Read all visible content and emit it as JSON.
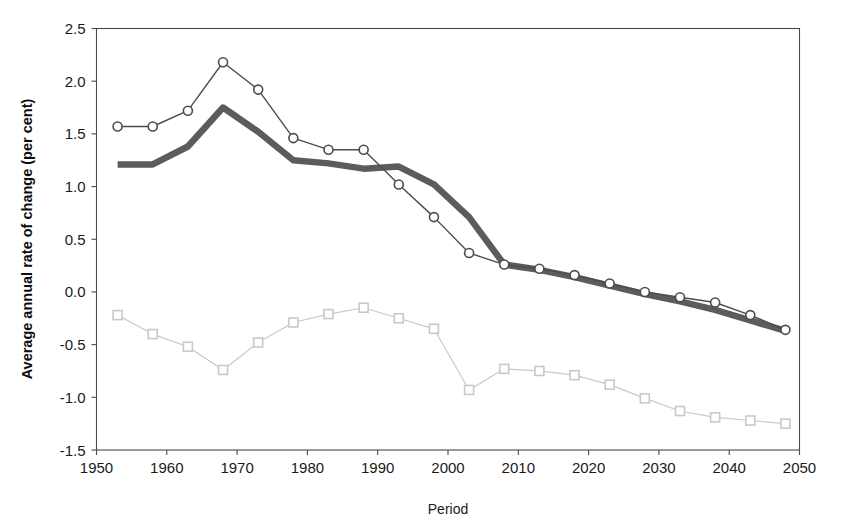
{
  "chart_data": {
    "type": "line",
    "title": "",
    "xlabel": "Period",
    "ylabel": "Average annual rate of change (per cent)",
    "xlim": [
      1950,
      2050
    ],
    "ylim": [
      -1.5,
      2.5
    ],
    "xticks": [
      1950,
      1960,
      1970,
      1980,
      1990,
      2000,
      2010,
      2020,
      2030,
      2040,
      2050
    ],
    "xtick_labels": [
      "1950",
      "1960",
      "1970",
      "1980",
      "1990",
      "2000",
      "2010",
      "2020",
      "2030",
      "2040",
      "2050"
    ],
    "yticks": [
      -1.5,
      -1.0,
      -0.5,
      0.0,
      0.5,
      1.0,
      1.5,
      2.0,
      2.5
    ],
    "ytick_labels": [
      "-1.5",
      "-1.0",
      "-0.5",
      "0.0",
      "0.5",
      "1.0",
      "1.5",
      "2.0",
      "2.5"
    ],
    "grid": false,
    "legend": "none",
    "x": [
      1953,
      1958,
      1963,
      1968,
      1973,
      1978,
      1983,
      1988,
      1993,
      1998,
      2003,
      2008,
      2013,
      2018,
      2023,
      2028,
      2033,
      2038,
      2043,
      2048
    ],
    "series": [
      {
        "name": "circle-series",
        "marker": "circle-open",
        "color": "#4d4d4d",
        "line_width": 1.4,
        "marker_size": 9,
        "x": [
          1953,
          1958,
          1963,
          1968,
          1973,
          1978,
          1983,
          1988,
          1993,
          1998,
          2003,
          2008,
          2013,
          2018,
          2023,
          2028,
          2033,
          2038,
          2043,
          2048
        ],
        "values": [
          1.57,
          1.57,
          1.72,
          2.18,
          1.92,
          1.46,
          1.35,
          1.35,
          1.02,
          0.71,
          0.37,
          0.26,
          0.22,
          0.16,
          0.08,
          0.0,
          -0.05,
          -0.1,
          -0.22,
          -0.36
        ]
      },
      {
        "name": "thick-gray-series",
        "marker": "none",
        "color": "#5c5c5c",
        "line_width": 6.5,
        "marker_size": 0,
        "x": [
          1953,
          1958,
          1963,
          1968,
          1973,
          1978,
          1983,
          1988,
          1993,
          1998,
          2003,
          2008,
          2013,
          2018,
          2023,
          2028,
          2033,
          2038,
          2043,
          2048
        ],
        "values": [
          1.21,
          1.21,
          1.38,
          1.75,
          1.52,
          1.25,
          1.22,
          1.17,
          1.19,
          1.02,
          0.71,
          0.26,
          0.21,
          0.14,
          0.06,
          -0.02,
          -0.09,
          -0.17,
          -0.27,
          -0.37
        ]
      },
      {
        "name": "square-series",
        "marker": "square-open",
        "color": "#c9c9c9",
        "line_width": 1.2,
        "marker_size": 9,
        "x": [
          1953,
          1958,
          1963,
          1968,
          1973,
          1978,
          1983,
          1988,
          1993,
          1998,
          2003,
          2008,
          2013,
          2018,
          2023,
          2028,
          2033,
          2038,
          2043,
          2048
        ],
        "values": [
          -0.22,
          -0.4,
          -0.52,
          -0.74,
          -0.48,
          -0.29,
          -0.21,
          -0.15,
          -0.25,
          -0.35,
          -0.93,
          -0.73,
          -0.75,
          -0.79,
          -0.88,
          -1.01,
          -1.13,
          -1.19,
          -1.22,
          -1.25
        ]
      }
    ]
  },
  "axes": {
    "y_axis_title": "Average annual rate of change (per cent)",
    "x_axis_title": "Period"
  },
  "colors": {
    "frame": "#4a4a4a",
    "text": "#1a1a1a",
    "circle_series": "#4d4d4d",
    "thick_series": "#5c5c5c",
    "square_series": "#c9c9c9",
    "background": "#ffffff"
  }
}
